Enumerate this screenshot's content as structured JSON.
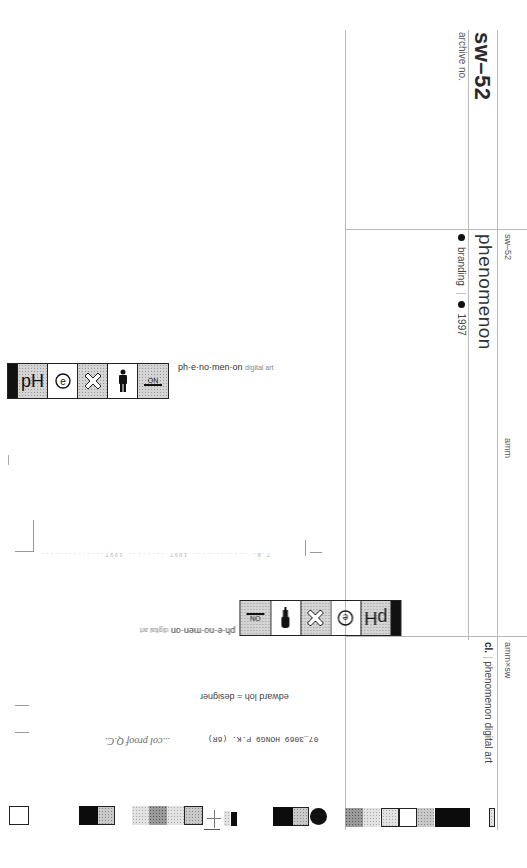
{
  "sheet": {
    "archive_number": "sw–52",
    "archive_label": "archive no.",
    "header_code": "sw–52",
    "project_title": "phenomenon",
    "meta": {
      "category": "branding",
      "year": "1997"
    },
    "studio_label": "amm",
    "credit_code": "amm×sw",
    "client_prefix": "cl.",
    "client_name": "phenomenon digital art"
  },
  "logos": [
    {
      "orientation": "upright",
      "tagline_main": "ph·e·no·men·on",
      "tagline_sub": "digital art",
      "cells": [
        {
          "icon": "ph-glyph",
          "text": "pH",
          "style": "grain"
        },
        {
          "icon": "e-circle-icon",
          "text": "ⓔ",
          "style": "plain"
        },
        {
          "icon": "x-cross-icon",
          "text": "✕",
          "style": "grain"
        },
        {
          "icon": "person-icon",
          "text": "🚹",
          "style": "plain"
        },
        {
          "icon": "on-switch-icon",
          "text": "ON",
          "style": "grain"
        }
      ]
    },
    {
      "orientation": "inverted",
      "tagline_main": "ph·e·no·men·on",
      "tagline_sub": "digital art"
    }
  ],
  "notes": {
    "designer_credit": "edward loh = designer",
    "print_code": "07_3069 HONG9 P.K. (6R)",
    "handwritten": "...col proof Q.C.",
    "faint_line": "T.B. ............ 1997 ........ 1997.............."
  },
  "color_bar": {
    "swatches": [
      "white",
      "black",
      "grey-grain",
      "grey-light",
      "grey-dark",
      "grey-light",
      "grey-bordered",
      "black",
      "grey-grain",
      "black-dot",
      "grey-dark",
      "grey-light",
      "grey-bordered",
      "white",
      "grey-grain",
      "black"
    ]
  }
}
